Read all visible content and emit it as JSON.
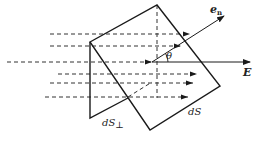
{
  "diagram": {
    "labels": {
      "normal": "e",
      "normal_sub": "n",
      "field": "E",
      "angle": "θ",
      "perp_area": "dS",
      "perp_sub": "⊥",
      "area": "dS"
    },
    "colors": {
      "line": "#1a1a1a",
      "dash": "#333333",
      "background": "#ffffff"
    }
  }
}
